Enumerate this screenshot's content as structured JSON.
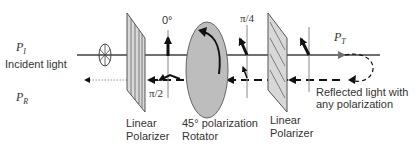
{
  "labels": {
    "p_incident": "P",
    "p_incident_sub": "I",
    "p_reflected": "P",
    "p_reflected_sub": "R",
    "p_transmitted": "P",
    "p_transmitted_sub": "T",
    "incident_light": "Incident light",
    "angle_zero": "0°",
    "angle_pi_2": "π/2",
    "angle_pi_4": "π/4",
    "polarizer1_line1": "Linear",
    "polarizer1_line2": "Polarizer",
    "rotator_line1": "45° polarization",
    "rotator_line2": "Rotator",
    "polarizer2_line1": "Linear",
    "polarizer2_line2": "Polarizer",
    "reflected_line1": "Reflected light with",
    "reflected_line2": "any polarization"
  },
  "colors": {
    "beam": "#707070",
    "polarizer_fill": "#d8d8d8",
    "polarizer_stroke": "#555555",
    "rotator_fill": "#bdbdbd",
    "vector": "#111111",
    "text": "#333333"
  }
}
